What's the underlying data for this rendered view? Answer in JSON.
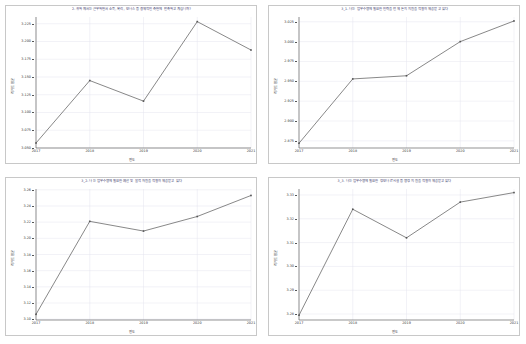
{
  "figure": {
    "layout": "2x2-grid",
    "background": "#ffffff",
    "panel_border_color": "#c8c8c8",
    "title_color": "#3b3b6b",
    "line_color": "#555555",
    "grid_color": "#e4e4ee"
  },
  "panels": [
    {
      "id": "panel-1",
      "title": "2. 귀하께서는 근무하면서 소득, 복리, 보너스 등 경제적인 측면에 만족하고 계십니까?",
      "xlabel": "연도",
      "ylabel": "리커트 평균",
      "chart_data": {
        "type": "line",
        "title": "2. 귀하께서는 근무하면서 소득, 복리, 보너스 등 경제적인 측면에 만족하고 계십니까?",
        "xlabel": "연도",
        "ylabel": "리커트 평균",
        "categories": [
          "2017",
          "2018",
          "2019",
          "2020",
          "2021"
        ],
        "values": [
          3.057,
          3.145,
          3.116,
          3.228,
          3.188
        ],
        "ylim": [
          3.05,
          3.2345
        ],
        "yticks": [
          3.05,
          3.075,
          3.1,
          3.125,
          3.15,
          3.175,
          3.2,
          3.225
        ],
        "ytick_labels": [
          "3.050",
          "3.075",
          "3.100",
          "3.125",
          "3.150",
          "3.175",
          "3.200",
          "3.225"
        ],
        "grid": true,
        "legend": "none",
        "marker": "point"
      }
    },
    {
      "id": "panel-2",
      "title": "3_1. 나는 업무수행에 필요한 인력을 언제 든지 지원을 적절히 제공받고 있다",
      "xlabel": "연도",
      "ylabel": "리커트 평균",
      "chart_data": {
        "type": "line",
        "title": "3_1. 나는 업무수행에 필요한 인력을 언제 든지 지원을 적절히 제공받고 있다",
        "xlabel": "연도",
        "ylabel": "리커트 평균",
        "categories": [
          "2017",
          "2018",
          "2019",
          "2020",
          "2021"
        ],
        "values": [
          2.872,
          2.953,
          2.957,
          3.0,
          3.026
        ],
        "ylim": [
          2.866,
          3.031
        ],
        "yticks": [
          2.875,
          2.9,
          2.925,
          2.95,
          2.975,
          3.0,
          3.025
        ],
        "ytick_labels": [
          "2.875",
          "2.900",
          "2.925",
          "2.950",
          "2.975",
          "3.000",
          "3.025"
        ],
        "grid": true,
        "legend": "none",
        "marker": "point"
      }
    },
    {
      "id": "panel-3",
      "title": "3_2. 나는 업무수행에 필요한 예산 및 물적 자원을 적절히 제공받고 있다",
      "xlabel": "연도",
      "ylabel": "리커트 평균",
      "chart_data": {
        "type": "line",
        "title": "3_2. 나는 업무수행에 필요한 예산 및 물적 자원을 적절히 제공받고 있다",
        "xlabel": "연도",
        "ylabel": "리커트 평균",
        "categories": [
          "2017",
          "2018",
          "2019",
          "2020",
          "2021"
        ],
        "values": [
          3.106,
          3.221,
          3.209,
          3.227,
          3.253
        ],
        "ylim": [
          3.099,
          3.261
        ],
        "yticks": [
          3.1,
          3.12,
          3.14,
          3.16,
          3.18,
          3.2,
          3.22,
          3.24,
          3.26
        ],
        "ytick_labels": [
          "3.10",
          "3.12",
          "3.14",
          "3.16",
          "3.18",
          "3.20",
          "3.22",
          "3.24",
          "3.26"
        ],
        "grid": true,
        "legend": "none",
        "marker": "point"
      }
    },
    {
      "id": "panel-4",
      "title": "3_3. 나는 업무수행에 필요한 정보나 IT시설 등 행정 지원을 적절히 제공받고 있다",
      "xlabel": "연도",
      "ylabel": "리커트 평균",
      "chart_data": {
        "type": "line",
        "title": "3_3. 나는 업무수행에 필요한 정보나 IT시설 등 행정 지원을 적절히 제공받고 있다",
        "xlabel": "연도",
        "ylabel": "리커트 평균",
        "categories": [
          "2017",
          "2018",
          "2019",
          "2020",
          "2021"
        ],
        "values": [
          3.2795,
          3.324,
          3.312,
          3.327,
          3.331
        ],
        "ylim": [
          3.2775,
          3.3325
        ],
        "yticks": [
          3.28,
          3.29,
          3.3,
          3.31,
          3.32,
          3.33
        ],
        "ytick_labels": [
          "3.28",
          "3.29",
          "3.30",
          "3.31",
          "3.32",
          "3.33"
        ],
        "grid": true,
        "legend": "none",
        "marker": "point"
      }
    }
  ]
}
